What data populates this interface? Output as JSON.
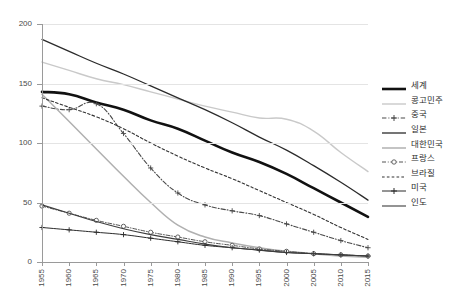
{
  "chart_data": {
    "type": "line",
    "title": "",
    "xlabel": "",
    "ylabel": "",
    "xlim": [
      1955,
      2015
    ],
    "ylim": [
      0,
      200
    ],
    "grid": true,
    "legend_position": "right",
    "categories": [
      1955,
      1960,
      1965,
      1970,
      1975,
      1980,
      1985,
      1990,
      1995,
      2000,
      2005,
      2010,
      2015
    ],
    "tick_labels_x": [
      "1955",
      "1960",
      "1965",
      "1970",
      "1975",
      "1980",
      "1985",
      "1990",
      "1995",
      "2000",
      "2005",
      "2010",
      "2015"
    ],
    "tick_labels_y": [
      "0",
      "50",
      "100",
      "150",
      "200"
    ],
    "series": [
      {
        "name": "세계",
        "color": "#111111",
        "width": 2.6,
        "dash": "none",
        "marker": "none",
        "values": [
          143,
          141,
          134,
          128,
          119,
          112,
          102,
          92,
          84,
          74,
          62,
          50,
          38
        ]
      },
      {
        "name": "콩고민주",
        "color": "#c9c9c9",
        "width": 1.4,
        "dash": "none",
        "marker": "none",
        "values": [
          168,
          161,
          154,
          149,
          143,
          137,
          131,
          126,
          121,
          120,
          110,
          92,
          76
        ]
      },
      {
        "name": "중국",
        "color": "#4a4a4a",
        "width": 1.1,
        "dash": "dashdot",
        "marker": "plus",
        "values": [
          131,
          128,
          133,
          108,
          79,
          58,
          48,
          43,
          39,
          32,
          25,
          18,
          12
        ]
      },
      {
        "name": "일본",
        "color": "#2b2b2b",
        "width": 1.3,
        "dash": "none",
        "marker": "none",
        "values": [
          187,
          177,
          167,
          158,
          148,
          138,
          128,
          117,
          105,
          94,
          81,
          67,
          52
        ]
      },
      {
        "name": "대한민국",
        "color": "#b0b0b0",
        "width": 1.5,
        "dash": "none",
        "marker": "none",
        "values": [
          141,
          118,
          95,
          72,
          50,
          31,
          21,
          16,
          12,
          9,
          7,
          5,
          4
        ]
      },
      {
        "name": "프랑스",
        "color": "#555555",
        "width": 1.0,
        "dash": "dashdot",
        "marker": "circle",
        "values": [
          47,
          41,
          35,
          30,
          25,
          21,
          17,
          14,
          11,
          9,
          7,
          6,
          5
        ]
      },
      {
        "name": "브라질",
        "color": "#333333",
        "width": 1.1,
        "dash": "dotted",
        "marker": "none",
        "values": [
          138,
          130,
          122,
          112,
          100,
          89,
          79,
          70,
          60,
          50,
          40,
          29,
          19
        ]
      },
      {
        "name": "미국",
        "color": "#2b2b2b",
        "width": 1.0,
        "dash": "none",
        "marker": "plus",
        "values": [
          29,
          27,
          25,
          23,
          20,
          17,
          14,
          12,
          10,
          8,
          7,
          6,
          5
        ]
      },
      {
        "name": "인도",
        "color": "#3d3d3d",
        "width": 1.1,
        "dash": "none",
        "marker": "none",
        "values": [
          48,
          41,
          34,
          28,
          23,
          19,
          15,
          12,
          10,
          8,
          7,
          6,
          5
        ]
      }
    ]
  }
}
